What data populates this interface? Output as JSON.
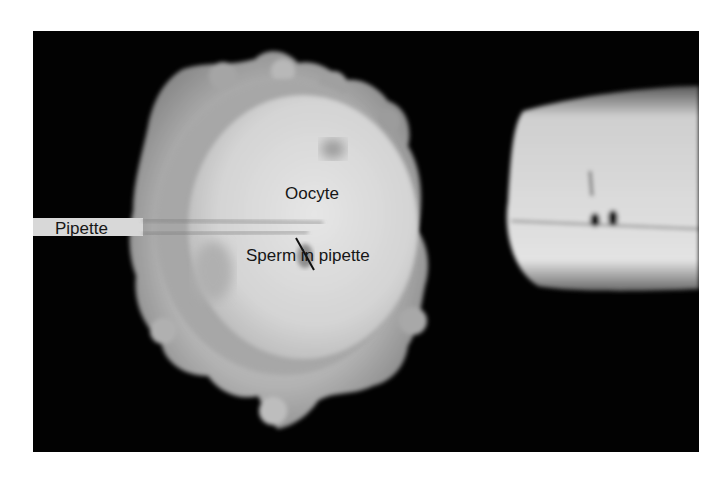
{
  "figure": {
    "type": "micrograph",
    "background_color": "#020202",
    "page_color": "#ffffff",
    "labels": {
      "pipette": "Pipette",
      "oocyte": "Oocyte",
      "sperm": "Sperm in pipette"
    }
  }
}
